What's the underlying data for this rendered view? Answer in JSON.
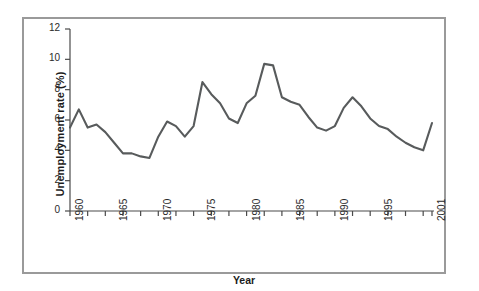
{
  "chart_data": {
    "type": "line",
    "title": "",
    "xlabel": "Year",
    "ylabel": "Unemployment rate (%)",
    "xlim": [
      1960,
      2001
    ],
    "ylim": [
      0,
      12
    ],
    "grid": false,
    "legend": null,
    "line_color": "#585b5c",
    "axis_color": "#4a4a4a",
    "frame_color": "#9a9a9a",
    "background": "#ffffff",
    "y_ticks": [
      0,
      2,
      4,
      6,
      8,
      10,
      12
    ],
    "y_tick_labels": [
      "0",
      "2",
      "4",
      "6",
      "8",
      "10",
      "12"
    ],
    "x_ticks": [
      1960,
      1961,
      1962,
      1963,
      1964,
      1965,
      1966,
      1967,
      1968,
      1969,
      1970,
      1971,
      1972,
      1973,
      1974,
      1975,
      1976,
      1977,
      1978,
      1979,
      1980,
      1981,
      1982,
      1983,
      1984,
      1985,
      1986,
      1987,
      1988,
      1989,
      1990,
      1991,
      1992,
      1993,
      1994,
      1995,
      1996,
      1997,
      1998,
      1999,
      2000,
      2001
    ],
    "x_major_ticks": [
      1960,
      1965,
      1970,
      1975,
      1980,
      1985,
      1990,
      1995,
      2001
    ],
    "x_tick_labels": [
      "1960",
      "1965",
      "1970",
      "1975",
      "1980",
      "1985",
      "1990",
      "1995",
      "2001"
    ],
    "x": [
      1960,
      1961,
      1962,
      1963,
      1964,
      1965,
      1966,
      1967,
      1968,
      1969,
      1970,
      1971,
      1972,
      1973,
      1974,
      1975,
      1976,
      1977,
      1978,
      1979,
      1980,
      1981,
      1982,
      1983,
      1984,
      1985,
      1986,
      1987,
      1988,
      1989,
      1990,
      1991,
      1992,
      1993,
      1994,
      1995,
      1996,
      1997,
      1998,
      1999,
      2000,
      2001
    ],
    "values": [
      5.5,
      6.7,
      5.5,
      5.7,
      5.2,
      4.5,
      3.8,
      3.8,
      3.6,
      3.5,
      4.9,
      5.9,
      5.6,
      4.9,
      5.6,
      8.5,
      7.7,
      7.1,
      6.1,
      5.8,
      7.1,
      7.6,
      9.7,
      9.6,
      7.5,
      7.2,
      7.0,
      6.2,
      5.5,
      5.3,
      5.6,
      6.8,
      7.5,
      6.9,
      6.1,
      5.6,
      5.4,
      4.9,
      4.5,
      4.2,
      4.0,
      5.8
    ],
    "series_name": "Unemployment rate"
  }
}
